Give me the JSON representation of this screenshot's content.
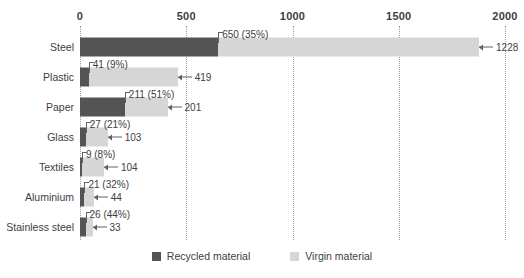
{
  "chart_data": {
    "type": "bar",
    "orientation": "horizontal",
    "stacked": true,
    "title": "",
    "subtitle": "",
    "xlabel": "",
    "ylabel": "",
    "xlim": [
      0,
      2000
    ],
    "xticks": [
      0,
      500,
      1000,
      1500,
      2000
    ],
    "xtick_labels": [
      "0",
      "500",
      "1000",
      "1500",
      "2000"
    ],
    "grid": true,
    "legend_position": "bottom-center",
    "categories": [
      "Steel",
      "Plastic",
      "Paper",
      "Glass",
      "Textiles",
      "Aluminium",
      "Stainless steel"
    ],
    "series": [
      {
        "name": "Recycled material",
        "color": "#545454",
        "values": [
          650,
          41,
          211,
          27,
          9,
          21,
          26
        ],
        "percent_labels": [
          "35%",
          "9%",
          "51%",
          "21%",
          "8%",
          "32%",
          "44%"
        ],
        "data_labels": [
          "650 (35%)",
          "41 (9%)",
          "211 (51%)",
          "27 (21%)",
          "9 (8%)",
          "21 (32%)",
          "26 (44%)"
        ]
      },
      {
        "name": "Virgin material",
        "color": "#d6d6d6",
        "values": [
          1228,
          419,
          201,
          103,
          104,
          44,
          33
        ],
        "data_labels": [
          "1228",
          "419",
          "201",
          "103",
          "104",
          "44",
          "33"
        ]
      }
    ],
    "totals": [
      1878,
      460,
      412,
      130,
      113,
      65,
      59
    ]
  },
  "axis": {
    "ticks": [
      {
        "value": 0,
        "label": "0"
      },
      {
        "value": 500,
        "label": "500"
      },
      {
        "value": 1000,
        "label": "1000"
      },
      {
        "value": 1500,
        "label": "1500"
      },
      {
        "value": 2000,
        "label": "2000"
      }
    ]
  },
  "rows": [
    {
      "category": "Steel",
      "recycled_label": "650 (35%)",
      "virgin_label": "1228"
    },
    {
      "category": "Plastic",
      "recycled_label": "41 (9%)",
      "virgin_label": "419"
    },
    {
      "category": "Paper",
      "recycled_label": "211 (51%)",
      "virgin_label": "201"
    },
    {
      "category": "Glass",
      "recycled_label": "27 (21%)",
      "virgin_label": "103"
    },
    {
      "category": "Textiles",
      "recycled_label": "9 (8%)",
      "virgin_label": "104"
    },
    {
      "category": "Aluminium",
      "recycled_label": "21 (32%)",
      "virgin_label": "44"
    },
    {
      "category": "Stainless steel",
      "recycled_label": "26 (44%)",
      "virgin_label": "33"
    }
  ],
  "legend": {
    "items": [
      {
        "label": "Recycled material",
        "color": "#545454"
      },
      {
        "label": "Virgin material",
        "color": "#d6d6d6"
      }
    ]
  },
  "colors": {
    "recycled": "#545454",
    "virgin": "#d6d6d6",
    "gridline": "#9aa0a6",
    "text": "#3c4043",
    "background": "#ffffff"
  }
}
